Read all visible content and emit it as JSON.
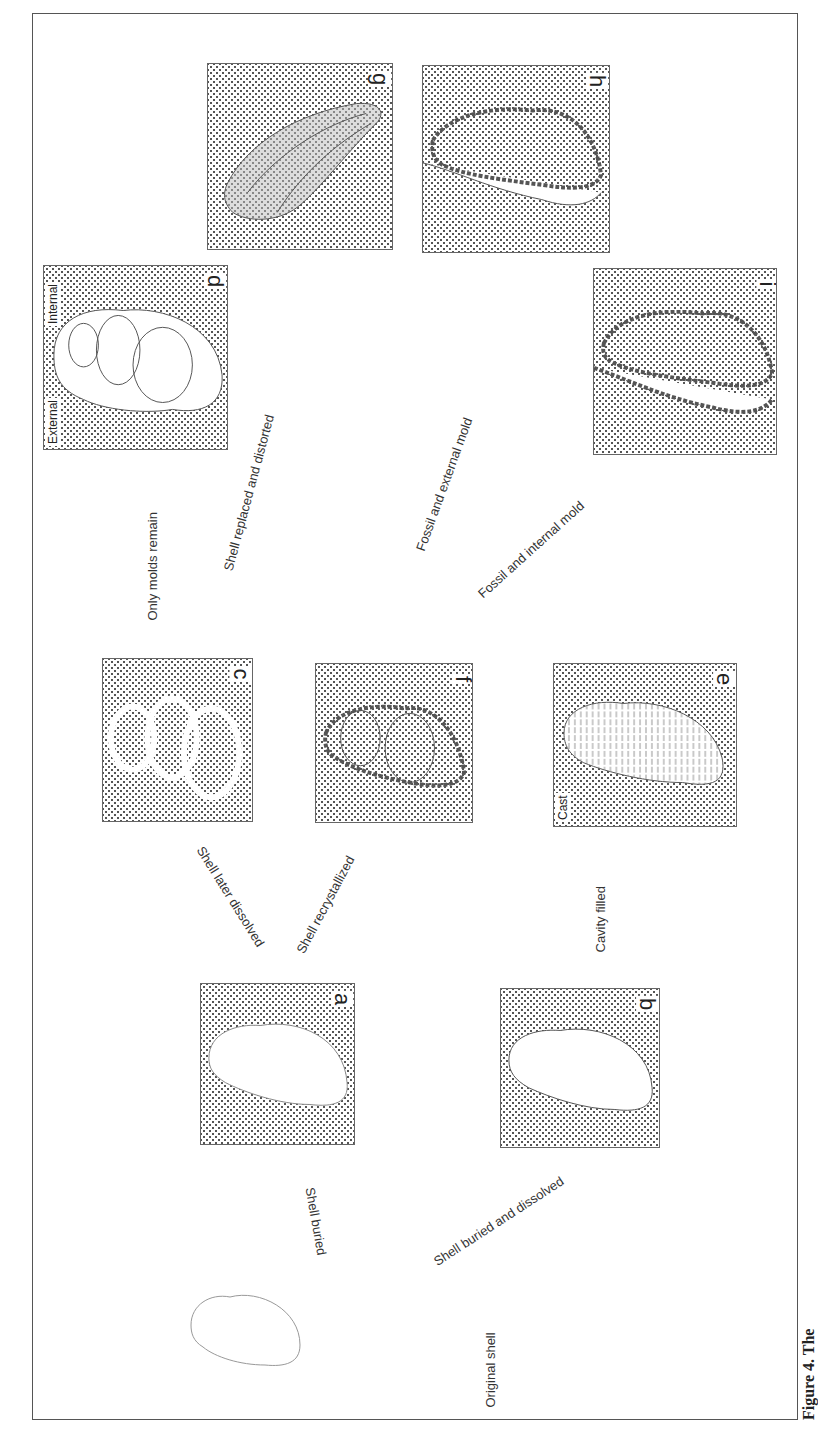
{
  "figure": {
    "caption": "Figure 4. The",
    "orientation": "rotated 90° clockwise (landscape figure on portrait page)"
  },
  "start": {
    "label": "Original shell"
  },
  "panels": [
    {
      "id": "a",
      "letter": "a",
      "content": "shell buried in sediment"
    },
    {
      "id": "b",
      "letter": "b",
      "content": "empty cavity in sediment"
    },
    {
      "id": "c",
      "letter": "c",
      "content": "molds after shell dissolved"
    },
    {
      "id": "d",
      "letter": "d",
      "content": "external and internal molds",
      "labels": [
        "External",
        "Internal"
      ]
    },
    {
      "id": "e",
      "letter": "e",
      "content": "cavity filled to form cast",
      "labels": [
        "Cast"
      ]
    },
    {
      "id": "f",
      "letter": "f",
      "content": "recrystallized shell"
    },
    {
      "id": "g",
      "letter": "g",
      "content": "shell replaced and distorted"
    },
    {
      "id": "h",
      "letter": "h",
      "content": "fossil and external mold"
    },
    {
      "id": "i",
      "letter": "i",
      "content": "fossil and internal mold"
    }
  ],
  "transitions": [
    {
      "from": "original",
      "to": "a",
      "label": "Shell buried"
    },
    {
      "from": "original",
      "to": "b",
      "label": "Shell buried and dissolved"
    },
    {
      "from": "a",
      "to": "c",
      "label": "Shell later dissolved"
    },
    {
      "from": "a",
      "to": "f",
      "label": "Shell recrystallized"
    },
    {
      "from": "b",
      "to": "e",
      "label": "Cavity filled"
    },
    {
      "from": "c",
      "to": "d",
      "label": "Only molds remain"
    },
    {
      "from": "f",
      "to": "g",
      "label": "Shell replaced and distorted"
    },
    {
      "from": "f",
      "to": "h",
      "label": "Fossil and external mold"
    },
    {
      "from": "f",
      "to": "i",
      "label": "Fossil and internal mold"
    }
  ]
}
